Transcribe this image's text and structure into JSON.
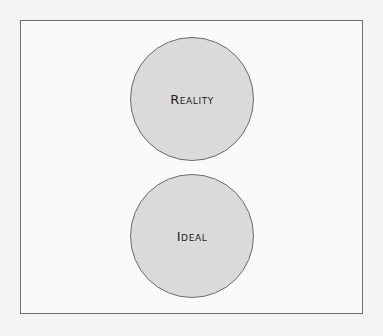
{
  "diagram": {
    "nodes": [
      {
        "id": "reality",
        "label": "Reality",
        "shape": "circle",
        "fill": "#dadada",
        "stroke": "#6a6a6a"
      },
      {
        "id": "ideal",
        "label": "Ideal",
        "shape": "circle",
        "fill": "#dadada",
        "stroke": "#6a6a6a"
      }
    ],
    "frame": {
      "stroke": "#6e6e6e",
      "fill": "#fafafa"
    }
  }
}
